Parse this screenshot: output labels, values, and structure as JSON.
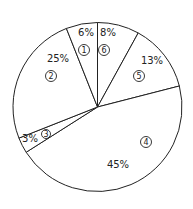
{
  "chart_data": {
    "type": "pie",
    "title": "",
    "start_angle_deg": 0,
    "direction": "clockwise",
    "slices": [
      {
        "id": "6",
        "label": "8%",
        "value": 8
      },
      {
        "id": "5",
        "label": "13%",
        "value": 13
      },
      {
        "id": "4",
        "label": "45%",
        "value": 45
      },
      {
        "id": "3",
        "label": "3%",
        "value": 3
      },
      {
        "id": "2",
        "label": "25%",
        "value": 25
      },
      {
        "id": "1",
        "label": "6%",
        "value": 6
      }
    ],
    "legend": "none",
    "colors": {
      "fill": "#ffffff",
      "stroke": "#222222"
    }
  }
}
